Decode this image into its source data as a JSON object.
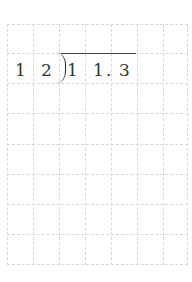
{
  "worksheet": {
    "type": "long-division-grid",
    "grid": {
      "columns": 7,
      "rows": 8,
      "line_color": "#d9d9d9",
      "line_style": "dashed"
    },
    "divisor": [
      "1",
      "2"
    ],
    "dividend": [
      "1",
      "1",
      ".",
      "3"
    ],
    "expression": "12 ) 11.3",
    "text_color": "#333333"
  }
}
